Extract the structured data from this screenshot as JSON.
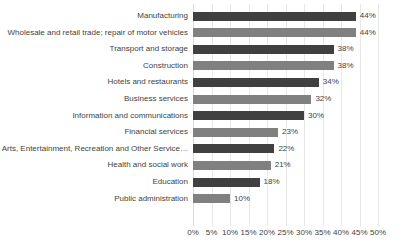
{
  "chart_data": {
    "type": "bar",
    "orientation": "horizontal",
    "title": "",
    "subtitle": "",
    "xlabel": "",
    "ylabel": "",
    "xlim": [
      0,
      50
    ],
    "xticks": [
      "0%",
      "5%",
      "10%",
      "15%",
      "20%",
      "25%",
      "30%",
      "35%",
      "40%",
      "45%",
      "50%"
    ],
    "xtick_values": [
      0,
      5,
      10,
      15,
      20,
      25,
      30,
      35,
      40,
      45,
      50
    ],
    "grid": true,
    "grid_axis": "x",
    "legend": "none",
    "value_suffix": "%",
    "categories": [
      "Manufacturing",
      "Wholesale and retail trade; repair of motor vehicles",
      "Transport and storage",
      "Construction",
      "Hotels and restaurants",
      "Business services",
      "Information and communications",
      "Financial services",
      "Arts, Entertainment, Recreation and Other Service…",
      "Health and social work",
      "Education",
      "Public administration"
    ],
    "values": [
      44,
      44,
      38,
      38,
      34,
      32,
      30,
      23,
      22,
      21,
      18,
      10
    ],
    "data_labels": [
      "44%",
      "44%",
      "38%",
      "38%",
      "34%",
      "32%",
      "30%",
      "23%",
      "22%",
      "21%",
      "18%",
      "10%"
    ],
    "bar_colors": [
      "#404040",
      "#808080",
      "#404040",
      "#808080",
      "#404040",
      "#808080",
      "#404040",
      "#808080",
      "#404040",
      "#808080",
      "#404040",
      "#808080"
    ],
    "colors": {
      "dark_bar": "#404040",
      "light_bar": "#808080",
      "gridline": "#e8e8e8",
      "text": "#3f3f3f",
      "background": "#ffffff"
    }
  }
}
